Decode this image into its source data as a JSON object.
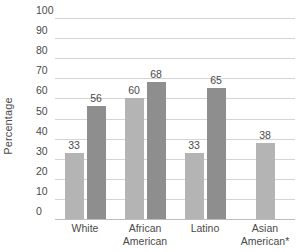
{
  "chart_data": {
    "type": "bar",
    "title": "",
    "xlabel": "",
    "ylabel": "Percentage",
    "ylim": [
      0,
      100
    ],
    "ytick_step": 10,
    "yticks": [
      100,
      90,
      80,
      70,
      60,
      50,
      40,
      30,
      20,
      10,
      0
    ],
    "grid": true,
    "legend": "none",
    "categories": [
      "White",
      "African American",
      "Latino",
      "Asian American*"
    ],
    "category_lines": [
      [
        "White"
      ],
      [
        "African",
        "American"
      ],
      [
        "Latino"
      ],
      [
        "Asian",
        "American*"
      ]
    ],
    "series": [
      {
        "name": "series-1",
        "color": "#b4b4b4",
        "values": [
          33,
          60,
          33,
          38
        ]
      },
      {
        "name": "series-2",
        "color": "#8e8e8e",
        "values": [
          56,
          68,
          65,
          null
        ]
      }
    ],
    "data_labels": [
      "33",
      "56",
      "60",
      "68",
      "33",
      "65",
      "38"
    ],
    "colors": {
      "series_light": "#b4b4b4",
      "series_dark": "#8e8e8e",
      "gridline": "#d5d5d5",
      "baseline": "#bdbdbd",
      "text": "#4a4a4a",
      "background": "#ffffff"
    }
  },
  "axis": {
    "y_title": "Percentage"
  }
}
